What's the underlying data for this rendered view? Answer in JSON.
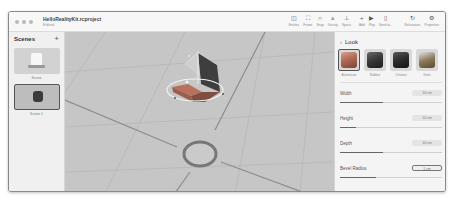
{
  "window": {
    "title": "HelloRealityKit.rcproject",
    "subtitle": "Edited"
  },
  "toolbar": [
    {
      "label": "Entities",
      "icon": "sidebar-icon",
      "glyph": "◫"
    },
    {
      "label": "Frame",
      "icon": "frame-icon",
      "glyph": "⛶"
    },
    {
      "label": "Snap",
      "icon": "magnet-icon",
      "glyph": "∩"
    },
    {
      "label": "Gravity",
      "icon": "gravity-icon",
      "glyph": "⩓"
    },
    {
      "label": "Space",
      "icon": "axes-icon",
      "glyph": "⊥"
    },
    {
      "label": "Add",
      "icon": "plus-icon",
      "glyph": "+"
    },
    {
      "label": "Play",
      "icon": "play-icon",
      "glyph": "▶"
    },
    {
      "label": "Send to...",
      "icon": "phone-icon",
      "glyph": "▯"
    },
    {
      "label": "Behaviours",
      "icon": "behaviours-icon",
      "glyph": "↻"
    },
    {
      "label": "Properties",
      "icon": "gear-icon",
      "glyph": "⚙"
    }
  ],
  "sidebar": {
    "title": "Scenes",
    "add_label": "+",
    "scenes": [
      {
        "label": "Scene",
        "selected": false
      },
      {
        "label": "Scene 1",
        "selected": true
      }
    ]
  },
  "inspector": {
    "back_label": "‹",
    "title": "Look",
    "materials": [
      {
        "label": "Aluminium",
        "color": "#b06a55",
        "selected": true
      },
      {
        "label": "Rubber",
        "color": "#3a3a3a",
        "selected": false
      },
      {
        "label": "Chrome",
        "color": "#2e2e2e",
        "selected": false
      },
      {
        "label": "Satin",
        "color": "#8a7a5a",
        "selected": false
      }
    ],
    "properties": [
      {
        "label": "Width",
        "value": "10 cm",
        "fill_pct": 42
      },
      {
        "label": "Height",
        "value": "10 cm",
        "fill_pct": 16
      },
      {
        "label": "Depth",
        "value": "10 cm",
        "fill_pct": 42
      },
      {
        "label": "Bevel Radius",
        "value": "1 cm",
        "fill_pct": 35
      }
    ]
  }
}
